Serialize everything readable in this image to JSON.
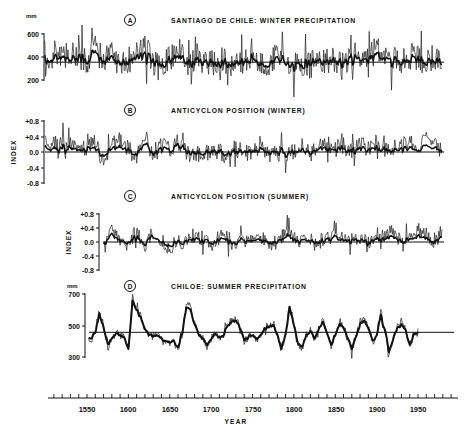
{
  "figure": {
    "x_axis": {
      "label": "YEAR",
      "ticks": [
        "1550",
        "1600",
        "1650",
        "1700",
        "1750",
        "1800",
        "1850",
        "1900",
        "1950"
      ],
      "range": [
        1503,
        1997
      ],
      "minor_tick_step": 10
    },
    "panels": [
      {
        "id": "A",
        "title": "SANTIAGO DE CHILE: WINTER PRECIPITATION",
        "unit": "mm",
        "y_ticks": [
          "600",
          "400",
          "200"
        ],
        "mean": 355
      },
      {
        "id": "B",
        "title": "ANTICYCLON POSITION (WINTER)",
        "unit": "INDEX",
        "y_ticks": [
          "+0.8",
          "+0.4",
          "0.0",
          "-0.4",
          "-0.8"
        ],
        "mean": 0.0
      },
      {
        "id": "C",
        "title": "ANTICYCLON POSITION (SUMMER)",
        "unit": "INDEX",
        "y_ticks": [
          "+0.8",
          "+0.4",
          "0.0",
          "-0.4",
          "-0.8"
        ],
        "mean": 0.0
      },
      {
        "id": "D",
        "title": "CHILOE: SUMMER PRECIPITATION",
        "unit": "mm",
        "y_ticks": [
          "700",
          "500",
          "300"
        ],
        "mean": 460
      }
    ]
  },
  "chart_data": [
    {
      "type": "line",
      "title": "SANTIAGO DE CHILE: WINTER PRECIPITATION",
      "xlabel": "YEAR",
      "ylabel": "mm",
      "ylim": [
        150,
        650
      ],
      "x": [
        1540,
        1550,
        1560,
        1570,
        1580,
        1590,
        1600,
        1610,
        1620,
        1630,
        1640,
        1650,
        1660,
        1670,
        1680,
        1690,
        1700,
        1710,
        1720,
        1730,
        1740,
        1750,
        1760,
        1770,
        1780,
        1790,
        1800,
        1810,
        1820,
        1830,
        1840,
        1850,
        1860,
        1870,
        1880,
        1890,
        1900,
        1910,
        1920,
        1930,
        1940,
        1950,
        1960,
        1970,
        1980
      ],
      "series": [
        {
          "name": "annual (thin)",
          "values": [
            420,
            380,
            470,
            360,
            420,
            330,
            380,
            410,
            480,
            350,
            300,
            390,
            460,
            370,
            340,
            360,
            330,
            380,
            350,
            310,
            360,
            450,
            320,
            350,
            400,
            330,
            340,
            310,
            330,
            400,
            370,
            380,
            350,
            410,
            430,
            370,
            470,
            380,
            390,
            360,
            420,
            380,
            370,
            400,
            350
          ]
        },
        {
          "name": "smoothed (thick)",
          "values": [
            390,
            370,
            420,
            360,
            380,
            340,
            370,
            390,
            420,
            360,
            320,
            370,
            410,
            360,
            345,
            350,
            340,
            360,
            350,
            330,
            350,
            400,
            330,
            345,
            370,
            335,
            340,
            325,
            335,
            380,
            360,
            370,
            350,
            385,
            400,
            360,
            420,
            370,
            375,
            355,
            390,
            365,
            360,
            375,
            350
          ]
        },
        {
          "name": "mean",
          "values": [
            355
          ]
        }
      ]
    },
    {
      "type": "line",
      "title": "ANTICYCLON POSITION (WINTER)",
      "xlabel": "YEAR",
      "ylabel": "INDEX",
      "ylim": [
        -0.9,
        0.9
      ],
      "x": [
        1540,
        1550,
        1560,
        1570,
        1580,
        1590,
        1600,
        1610,
        1620,
        1630,
        1640,
        1650,
        1660,
        1670,
        1680,
        1690,
        1700,
        1710,
        1720,
        1730,
        1740,
        1750,
        1760,
        1770,
        1780,
        1790,
        1800,
        1810,
        1820,
        1830,
        1840,
        1850,
        1860,
        1870,
        1880,
        1890,
        1900,
        1910,
        1920,
        1930,
        1940,
        1950,
        1960,
        1970,
        1980
      ],
      "series": [
        {
          "name": "annual (thin)",
          "values": [
            0.2,
            0.1,
            0.25,
            -0.3,
            0.15,
            0.3,
            0.1,
            -0.2,
            0.45,
            -0.1,
            0.15,
            0.05,
            0.3,
            -0.05,
            0.0,
            -0.1,
            0.05,
            0.0,
            -0.1,
            0.1,
            -0.05,
            0.05,
            0.1,
            -0.1,
            0.0,
            -0.05,
            0.0,
            0.15,
            -0.1,
            0.25,
            0.2,
            0.1,
            0.15,
            0.05,
            0.2,
            0.1,
            0.15,
            0.2,
            0.1,
            0.15,
            0.25,
            0.1,
            0.3,
            0.2,
            0.1
          ]
        },
        {
          "name": "smoothed (thick)",
          "values": [
            0.08,
            0.05,
            0.1,
            -0.12,
            0.06,
            0.12,
            0.05,
            -0.1,
            0.25,
            -0.05,
            0.06,
            0.02,
            0.2,
            -0.02,
            0.0,
            -0.05,
            0.02,
            0.0,
            -0.05,
            0.04,
            -0.02,
            0.02,
            0.05,
            -0.05,
            0.0,
            -0.03,
            0.0,
            0.06,
            -0.05,
            0.12,
            0.1,
            0.05,
            0.07,
            0.02,
            0.08,
            0.05,
            0.07,
            0.08,
            0.05,
            0.06,
            0.1,
            0.05,
            0.12,
            0.08,
            0.05
          ]
        },
        {
          "name": "mean",
          "values": [
            0.0
          ]
        }
      ]
    },
    {
      "type": "line",
      "title": "ANTICYCLON POSITION (SUMMER)",
      "xlabel": "YEAR",
      "ylabel": "INDEX",
      "ylim": [
        -0.9,
        0.9
      ],
      "x": [
        1570,
        1580,
        1590,
        1600,
        1610,
        1620,
        1630,
        1640,
        1650,
        1660,
        1670,
        1680,
        1690,
        1700,
        1710,
        1720,
        1730,
        1740,
        1750,
        1760,
        1770,
        1780,
        1790,
        1800,
        1810,
        1820,
        1830,
        1840,
        1850,
        1860,
        1870,
        1880,
        1890,
        1900,
        1910,
        1920,
        1930,
        1940,
        1950,
        1960,
        1970,
        1980
      ],
      "series": [
        {
          "name": "annual (thin)",
          "values": [
            -0.2,
            0.35,
            0.1,
            -0.05,
            0.3,
            -0.1,
            0.3,
            0.1,
            -0.2,
            0.05,
            0.0,
            0.2,
            0.1,
            -0.05,
            0.15,
            0.1,
            -0.1,
            0.05,
            0.0,
            0.1,
            -0.05,
            0.0,
            0.25,
            0.1,
            0.05,
            0.1,
            0.0,
            0.15,
            0.2,
            0.05,
            0.1,
            0.15,
            -0.1,
            0.2,
            0.15,
            0.3,
            0.05,
            0.1,
            0.35,
            0.2,
            0.05,
            0.3
          ]
        },
        {
          "name": "smoothed (thick)",
          "values": [
            -0.1,
            0.2,
            0.05,
            -0.02,
            0.15,
            -0.05,
            0.2,
            0.05,
            -0.1,
            0.02,
            0.0,
            0.1,
            0.05,
            -0.02,
            0.07,
            0.05,
            -0.05,
            0.02,
            0.0,
            0.05,
            -0.02,
            0.0,
            0.12,
            0.05,
            0.02,
            0.05,
            0.0,
            0.07,
            0.1,
            0.02,
            0.05,
            0.08,
            -0.05,
            0.1,
            0.08,
            0.15,
            0.02,
            0.05,
            0.18,
            0.1,
            0.02,
            0.15
          ]
        },
        {
          "name": "mean",
          "values": [
            0.0
          ]
        }
      ]
    },
    {
      "type": "line",
      "title": "CHILOE: SUMMER PRECIPITATION",
      "xlabel": "YEAR",
      "ylabel": "mm",
      "ylim": [
        280,
        720
      ],
      "x": [
        1555,
        1560,
        1565,
        1570,
        1575,
        1580,
        1585,
        1590,
        1595,
        1600,
        1605,
        1610,
        1615,
        1620,
        1625,
        1630,
        1635,
        1640,
        1645,
        1650,
        1655,
        1660,
        1665,
        1670,
        1675,
        1680,
        1685,
        1690,
        1695,
        1700,
        1705,
        1710,
        1715,
        1720,
        1725,
        1730,
        1735,
        1740,
        1745,
        1750,
        1755,
        1760,
        1765,
        1770,
        1775,
        1780,
        1785,
        1790,
        1795,
        1800,
        1805,
        1810,
        1815,
        1820,
        1825,
        1830,
        1835,
        1840,
        1845,
        1850,
        1855,
        1860,
        1865,
        1870,
        1875,
        1880,
        1885,
        1890,
        1895,
        1900,
        1905,
        1910,
        1915,
        1920,
        1925,
        1930,
        1935,
        1940,
        1945,
        1950,
        1955,
        1960,
        1965,
        1970,
        1975,
        1980
      ],
      "series": [
        {
          "name": "annual (thin)",
          "values": [
            400,
            470,
            600,
            500,
            350,
            420,
            460,
            440,
            430,
            330,
            690,
            610,
            560,
            480,
            440,
            430,
            450,
            410,
            400,
            390,
            400,
            340,
            440,
            640,
            620,
            520,
            440,
            420,
            360,
            420,
            450,
            420,
            440,
            500,
            540,
            550,
            500,
            400,
            430,
            450,
            410,
            450,
            500,
            500,
            520,
            440,
            330,
            460,
            640,
            520,
            380,
            360,
            440,
            470,
            420,
            490,
            530,
            460,
            380,
            440,
            520,
            500,
            420,
            350,
            430,
            520,
            540,
            490,
            400,
            440,
            590,
            480,
            330,
            410,
            490,
            500,
            480,
            360,
            450,
            460
          ]
        },
        {
          "name": "smoothed (thick)",
          "values": [
            420,
            460,
            580,
            490,
            380,
            420,
            455,
            440,
            425,
            350,
            660,
            600,
            550,
            480,
            445,
            430,
            440,
            415,
            405,
            395,
            400,
            360,
            450,
            620,
            600,
            510,
            445,
            420,
            380,
            420,
            445,
            425,
            440,
            495,
            530,
            535,
            490,
            410,
            430,
            445,
            415,
            450,
            490,
            495,
            510,
            445,
            350,
            455,
            620,
            510,
            390,
            370,
            440,
            465,
            425,
            485,
            520,
            455,
            385,
            440,
            510,
            495,
            425,
            365,
            430,
            510,
            530,
            485,
            405,
            440,
            570,
            475,
            345,
            415,
            485,
            495,
            475,
            375,
            450,
            460
          ]
        },
        {
          "name": "mean",
          "values": [
            460
          ]
        }
      ]
    }
  ]
}
